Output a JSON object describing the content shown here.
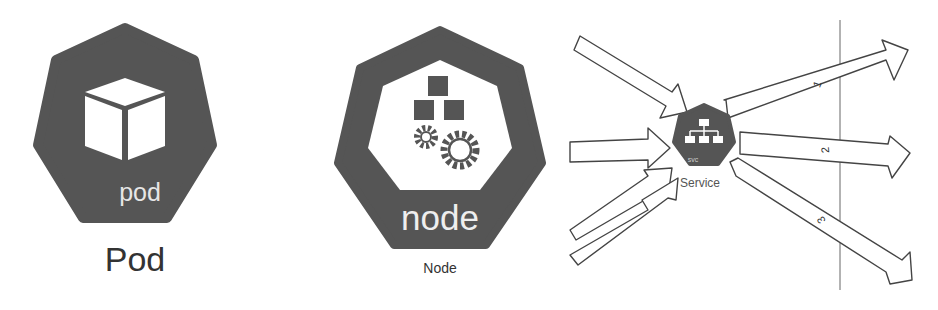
{
  "pod": {
    "inner_label": "pod",
    "caption": "Pod",
    "icon": "cube-icon",
    "fill": "#555555"
  },
  "node": {
    "inner_label": "node",
    "caption": "Node",
    "icons": [
      "cubes-icon",
      "gears-icon"
    ],
    "fill": "#555555"
  },
  "service": {
    "inner_label": "svc",
    "caption": "Service",
    "icon": "network-hierarchy-icon",
    "fill": "#555555",
    "incoming_arrows": 4,
    "outgoing_arrows": [
      {
        "label": "1"
      },
      {
        "label": "2"
      },
      {
        "label": "3"
      }
    ]
  }
}
